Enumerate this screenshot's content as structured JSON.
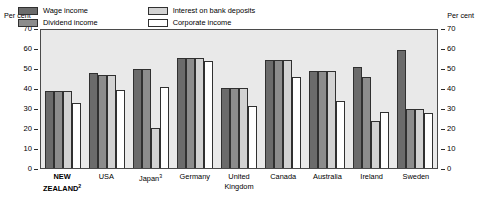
{
  "top_strip": {
    "text": ""
  },
  "axis_titles": {
    "left": "Per cent",
    "right": "Per cent"
  },
  "legend": {
    "items": [
      {
        "label": "Wage income",
        "key": "wage",
        "color": "#6b6b6b"
      },
      {
        "label": "Interest on bank deposits",
        "key": "interest",
        "color": "#d2d2d2"
      },
      {
        "label": "Dividend income",
        "key": "dividend",
        "color": "#8c8c8c"
      },
      {
        "label": "Corporate income",
        "key": "corporate",
        "color": "#ffffff"
      }
    ]
  },
  "y_ticks": [
    "70",
    "60",
    "50",
    "40",
    "30",
    "20",
    "10",
    "0"
  ],
  "x_labels": [
    {
      "text": "NEW\nZEALAND",
      "sup": "2",
      "bold": true
    },
    {
      "text": "USA",
      "sup": "",
      "bold": false
    },
    {
      "text": "Japan",
      "sup": "3",
      "bold": false
    },
    {
      "text": "Germany",
      "sup": "",
      "bold": false
    },
    {
      "text": "United\nKingdom",
      "sup": "",
      "bold": false
    },
    {
      "text": "Canada",
      "sup": "",
      "bold": false
    },
    {
      "text": "Australia",
      "sup": "",
      "bold": false
    },
    {
      "text": "Ireland",
      "sup": "",
      "bold": false
    },
    {
      "text": "Sweden",
      "sup": "",
      "bold": false
    }
  ],
  "chart_data": {
    "type": "bar",
    "title": "",
    "xlabel": "",
    "ylabel": "Per cent",
    "ylim": [
      0,
      70
    ],
    "ytick_step": 10,
    "grid": false,
    "legend_position": "inside-top",
    "categories": [
      "NEW ZEALAND",
      "USA",
      "Japan",
      "Germany",
      "United Kingdom",
      "Canada",
      "Australia",
      "Ireland",
      "Sweden"
    ],
    "series": [
      {
        "name": "Wage income",
        "values": [
          39,
          48,
          50,
          56,
          40.5,
          55,
          49,
          51,
          60
        ]
      },
      {
        "name": "Dividend income",
        "values": [
          39,
          47,
          50,
          56,
          40.5,
          55,
          49,
          46,
          30
        ]
      },
      {
        "name": "Interest on bank deposits",
        "values": [
          39,
          47,
          20.5,
          56,
          40.5,
          55,
          49,
          24,
          30
        ]
      },
      {
        "name": "Corporate income",
        "values": [
          33,
          39.5,
          41,
          54.5,
          31.5,
          46,
          34,
          28.5,
          28
        ]
      }
    ]
  }
}
